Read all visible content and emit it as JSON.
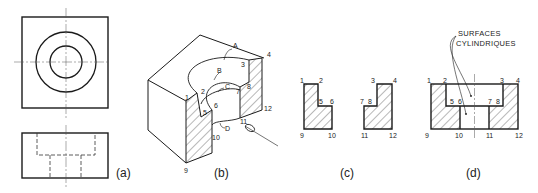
{
  "figure": {
    "panels": [
      {
        "id": "a",
        "caption": "(a)",
        "description": "Top and front orthographic views"
      },
      {
        "id": "b",
        "caption": "(b)",
        "description": "Isometric cutaway view"
      },
      {
        "id": "c",
        "caption": "(c)",
        "description": "Separate section faces"
      },
      {
        "id": "d",
        "caption": "(d)",
        "description": "Full section view"
      }
    ],
    "panel_b": {
      "surface_labels": [
        "A",
        "B",
        "C",
        "D"
      ],
      "point_labels": [
        "1",
        "2",
        "3",
        "4",
        "5",
        "6",
        "7",
        "8",
        "9",
        "10",
        "11",
        "12"
      ]
    },
    "panel_c": {
      "left_labels": [
        "1",
        "2",
        "5",
        "6",
        "9",
        "10"
      ],
      "right_labels": [
        "3",
        "4",
        "7",
        "8",
        "11",
        "12"
      ]
    },
    "panel_d": {
      "annotation_line1": "SURFACES",
      "annotation_line2": "CYLINDRIQUES",
      "top_labels": [
        "1",
        "2",
        "3",
        "4"
      ],
      "mid_labels": [
        "5",
        "6",
        "7",
        "8"
      ],
      "bottom_labels": [
        "9",
        "10",
        "11",
        "12"
      ]
    },
    "colors": {
      "line": "#1a1a1a",
      "hatch": "#333333",
      "background": "#ffffff"
    }
  }
}
